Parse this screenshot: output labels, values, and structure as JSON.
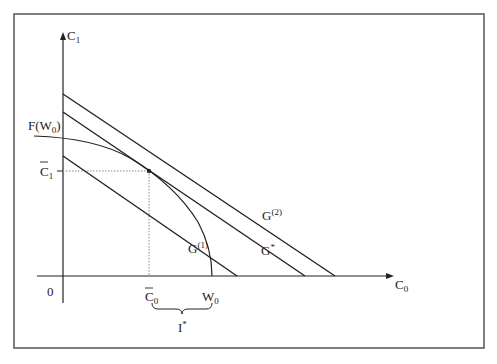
{
  "diagram": {
    "type": "intertemporal-consumption-diagram",
    "axes": {
      "x": {
        "label": "C",
        "label_sub": "0",
        "origin_label": "0"
      },
      "y": {
        "label": "C",
        "label_sub": "1"
      }
    },
    "curves": [
      {
        "id": "production-frontier",
        "label": "F(W",
        "label_sub": "0",
        "label_tail": ")",
        "kind": "concave curve"
      },
      {
        "id": "G1",
        "label": "G",
        "label_sup": "(1)",
        "kind": "straight line"
      },
      {
        "id": "Gstar",
        "label": "G",
        "label_sup": "*",
        "kind": "tangent straight line"
      },
      {
        "id": "G2",
        "label": "G",
        "label_sup": "(2)",
        "kind": "straight line"
      }
    ],
    "x_ticks": [
      {
        "id": "c0-bar",
        "label": "C",
        "label_sub": "0",
        "overbar": true
      },
      {
        "id": "w0",
        "label": "W",
        "label_sub": "0"
      }
    ],
    "y_ticks": [
      {
        "id": "c1-bar",
        "label": "C",
        "label_sub": "1",
        "overbar": true
      }
    ],
    "brace": {
      "label": "I",
      "label_sup": "*",
      "from": "c0-bar",
      "to": "w0"
    },
    "colors": {
      "line": "#222222",
      "frame": "#555555",
      "dotted": "#888888"
    }
  }
}
